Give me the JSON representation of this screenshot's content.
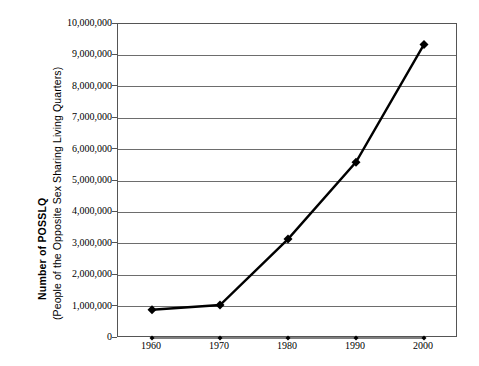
{
  "chart_data": {
    "type": "line",
    "title": "",
    "subtitle": "",
    "xlabel": "",
    "ylabel_main": "Number of POSSLQ",
    "ylabel_sub": "(People of the Opposite Sex Sharing Living Quarters)",
    "categories": [
      "1960",
      "1970",
      "1980",
      "1990",
      "2000"
    ],
    "x": [
      1960,
      1970,
      1980,
      1990,
      2000
    ],
    "xlim": [
      1955,
      2005
    ],
    "ylim": [
      0,
      10000000
    ],
    "ytick_values": [
      0,
      1000000,
      2000000,
      3000000,
      4000000,
      5000000,
      6000000,
      7000000,
      8000000,
      9000000,
      10000000
    ],
    "ytick_labels": [
      "0",
      "1,000,000",
      "2,000,000",
      "3,000,000",
      "4,000,000",
      "5,000,000",
      "6,000,000",
      "7,000,000",
      "8,000,000",
      "9,000,000",
      "10,000,000"
    ],
    "grid": true,
    "grid_axis": "y",
    "legend": false,
    "legend_position": "none",
    "series": [
      {
        "name": "POSSLQ",
        "values": [
          900000,
          1050000,
          3150000,
          5600000,
          9350000
        ],
        "color": "#000000",
        "marker": "diamond",
        "marker_size": 9,
        "line_width": 2.4
      },
      {
        "name": "Baseline",
        "values": [
          0,
          0,
          0,
          0,
          0
        ],
        "color": "#000000",
        "marker": "diamond",
        "marker_size": 5,
        "line_width": 1.1
      }
    ]
  },
  "style": {
    "frame_color": "#555555",
    "gridline_color": "#6d6d6d",
    "background": "#ffffff",
    "text_color": "#000000"
  }
}
